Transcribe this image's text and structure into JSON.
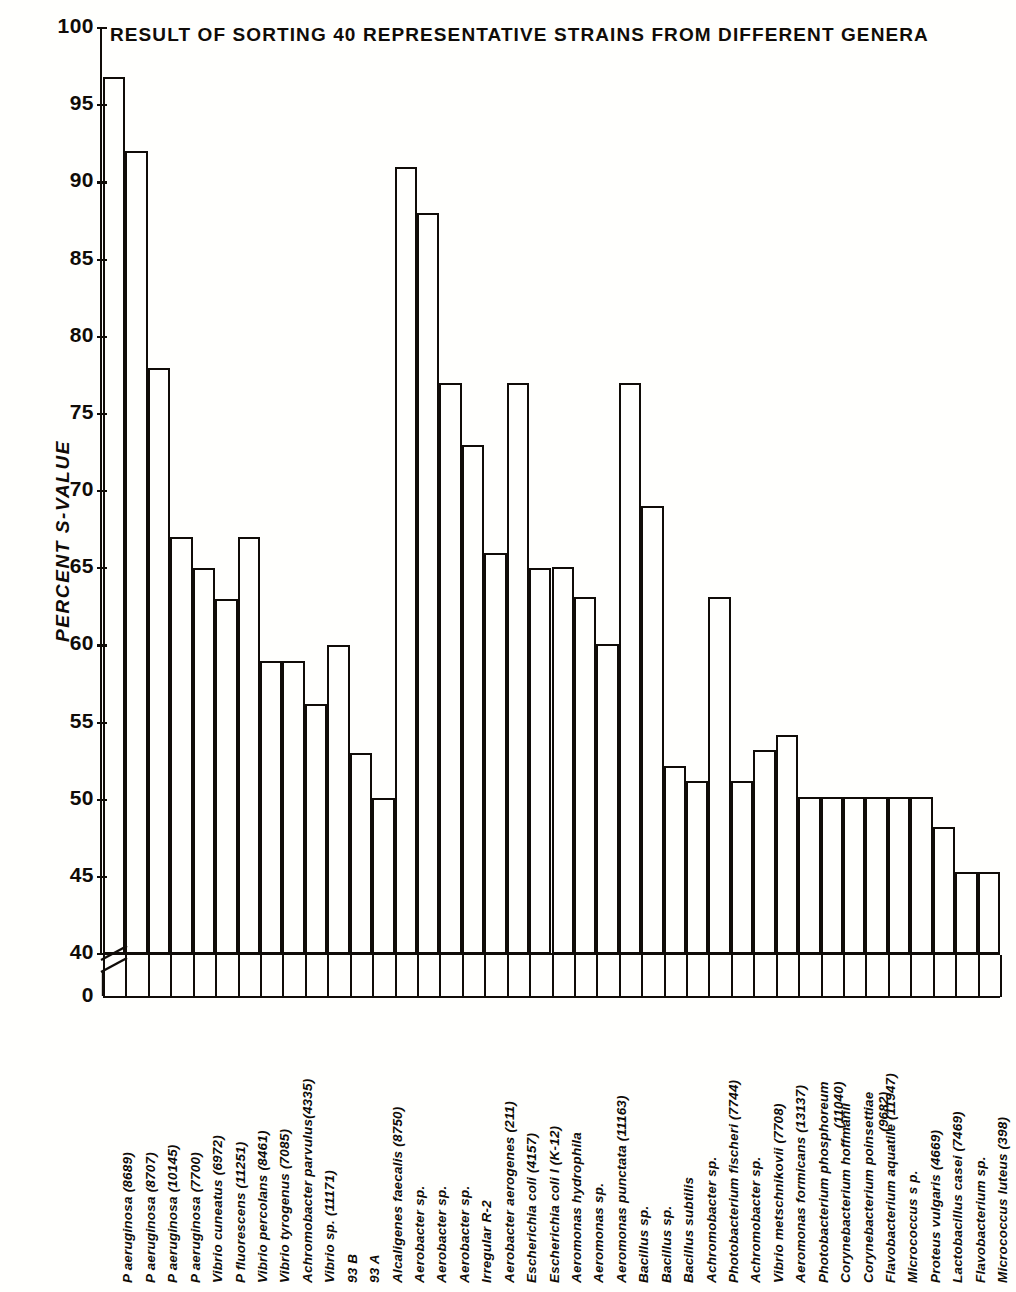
{
  "chart_data": {
    "type": "bar",
    "title": "RESULT OF SORTING 40 REPRESENTATIVE STRAINS FROM DIFFERENT GENERA",
    "xlabel": "",
    "ylabel": "PERCENT S-VALUE",
    "ylim": [
      40,
      100
    ],
    "y_axis_break_to": 0,
    "grid": false,
    "legend": null,
    "yticks": [
      100,
      95,
      90,
      85,
      80,
      75,
      70,
      65,
      60,
      55,
      50,
      45,
      40,
      0
    ],
    "ytick_labels": [
      "100",
      "95",
      "90",
      "85",
      "80",
      "75",
      "70",
      "65",
      "60",
      "55",
      "50",
      "45",
      "40",
      "0"
    ],
    "bar_style": "outline",
    "n_bars": 40,
    "categories": [
      "P. aeruginosa  (8689)",
      "P. aeruginosa  (8707)",
      "P. aeruginosa  (10145)",
      "P. aeruginosa  (7700)",
      "Vibrio cuneatus  (6972)",
      "P. fluorescens  (11251)",
      "Vibrio  percolans  (8461)",
      "Vibrio  tyrogenus  (7085)",
      "Achromobacter parvulus (4335)",
      "Vibrio  sp.  (11171)",
      "93  B",
      "93  A",
      "Alcaligenes faecalis (8750)",
      "Aerobacter sp.",
      "Aerobacter sp.",
      "Aerobacter sp.",
      "Irregular  R-2",
      "Aerobacter aerogenes (211)",
      "Escherichia coli  (4157)",
      "Escherichia coli I (K-12)",
      "Aeromonas  hydrophila",
      "Aeromonas  sp.",
      "Aeromonas punctata (11163)",
      "Bacillus  sp.",
      "Bacillus  sp.",
      "Bacillus  subtilis",
      "Achromobacter sp.",
      "Photobacterium fischeri (7744)",
      "Achromobacter sp.",
      "Vibrio  metschnikovii (7708)",
      "Aeromonas formicans (13137)",
      "Photobacterium phosphoreum (11040)",
      "Corynebacterium hoffmanii",
      "Corynebacterium poinsettiae (9682)",
      "Flavobacterium aquatile (11947)",
      "Micrococcus s p.",
      "Proteus vulgaris (4669)",
      "Lactobacillus casei (7469)",
      "Flavobacterium sp.",
      "Micrococcus luteus (398)"
    ],
    "category_lines": [
      [
        "P  aeruginosa  (8689)"
      ],
      [
        "P  aeruginosa  (8707)"
      ],
      [
        "P  aeruginosa  (10145)"
      ],
      [
        "P  aeruginosa  (7700)"
      ],
      [
        "Vibrio cuneatus  (6972)"
      ],
      [
        "P  fluorescens  (11251)"
      ],
      [
        "Vibrio  percolans  (8461)"
      ],
      [
        "Vibrio  tyrogenus  (7085)"
      ],
      [
        "Achromobacter parvulus(4335)"
      ],
      [
        "Vibrio  sp.  (11171)"
      ],
      [
        "93  B"
      ],
      [
        "93  A"
      ],
      [
        "Alcaligenes faecalis (8750)"
      ],
      [
        "Aerobacter sp."
      ],
      [
        "Aerobacter sp."
      ],
      [
        "Aerobacter sp."
      ],
      [
        "Irregular  R-2"
      ],
      [
        "Aerobacter aerogenes (211)"
      ],
      [
        "Escherichia coli  (4157)"
      ],
      [
        "Escherichia coli I (K-12)"
      ],
      [
        "Aeromonas  hydrophila"
      ],
      [
        "Aeromonas  sp."
      ],
      [
        "Aeromonas punctata (11163)"
      ],
      [
        "Bacillus  sp."
      ],
      [
        "Bacillus  sp."
      ],
      [
        "Bacillus  subtilis"
      ],
      [
        "Achromobacter sp."
      ],
      [
        "Photobacterium fischeri (7744)"
      ],
      [
        "Achromobacter sp."
      ],
      [
        "Vibrio  metschnikovii (7708)"
      ],
      [
        "Aeromonas formicans (13137)"
      ],
      [
        "Photobacterium phosphoreum",
        "(11040)"
      ],
      [
        "Corynebacterium hoffmanii"
      ],
      [
        "Corynebacterium poinsettiae",
        "(9682)"
      ],
      [
        "Flavobacterium aquatile (11947)"
      ],
      [
        "Micrococcus s p."
      ],
      [
        "Proteus vulgaris (4669)"
      ],
      [
        "Lactobacillus casei (7469)"
      ],
      [
        "Flavobacterium sp."
      ],
      [
        "Micrococcus luteus (398)"
      ]
    ],
    "values": [
      96.8,
      92.0,
      78.0,
      67.0,
      65.0,
      63.0,
      67.0,
      59.0,
      59.0,
      56.2,
      60.0,
      53.0,
      50.1,
      91.0,
      88.0,
      77.0,
      73.0,
      66.0,
      77.0,
      65.0,
      65.1,
      63.1,
      60.1,
      77.0,
      69.0,
      52.2,
      51.2,
      63.1,
      51.2,
      53.2,
      54.2,
      50.2,
      50.2,
      50.2,
      50.2,
      50.2,
      50.2,
      48.2,
      45.3,
      45.3
    ],
    "values_display": [
      "96.8",
      "92",
      "78",
      "67",
      "65",
      "63",
      "67",
      "59",
      "59",
      "56",
      "60",
      "53",
      "50",
      "91",
      "88",
      "77",
      "73",
      "66",
      "77",
      "65",
      "65",
      "63",
      "60",
      "77",
      "69",
      "52",
      "51",
      "63",
      "51",
      "53",
      "54",
      "50",
      "50",
      "50",
      "50",
      "50",
      "50",
      "48",
      "45",
      "45"
    ]
  }
}
